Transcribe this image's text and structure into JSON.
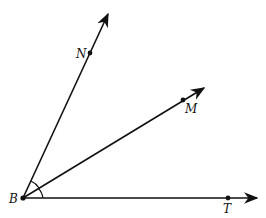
{
  "diagram": {
    "type": "geometry-angles",
    "vertex": {
      "label": "B",
      "x": 23,
      "y": 198
    },
    "rays": [
      {
        "name": "ray-BN",
        "point_label": "N",
        "point": [
          90,
          53
        ],
        "tip": [
          108,
          14
        ],
        "label_pos": [
          76,
          58
        ]
      },
      {
        "name": "ray-BM",
        "point_label": "M",
        "point": [
          183,
          100
        ],
        "tip": [
          204,
          88
        ],
        "label_pos": [
          186,
          113
        ]
      },
      {
        "name": "ray-BT",
        "point_label": "T",
        "point": [
          228,
          198
        ],
        "tip": [
          257,
          198
        ],
        "label_pos": [
          223,
          212
        ]
      }
    ],
    "angle_marks": 2,
    "colors": {
      "stroke": "#111111",
      "background": "#ffffff"
    }
  }
}
